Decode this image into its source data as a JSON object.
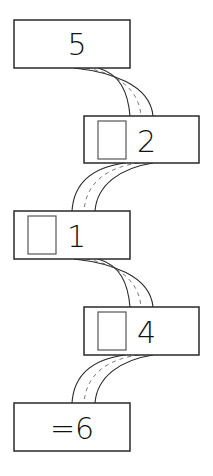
{
  "diagram": {
    "type": "number-chain",
    "boxes": [
      {
        "id": "start",
        "value": "5",
        "has_slot": false
      },
      {
        "id": "step1",
        "value": "2",
        "has_slot": true
      },
      {
        "id": "step2",
        "value": "1",
        "has_slot": true
      },
      {
        "id": "step3",
        "value": "4",
        "has_slot": true
      },
      {
        "id": "result",
        "value": "=6",
        "has_slot": false
      }
    ],
    "connectors": 4
  },
  "colors": {
    "stroke": "#2a2a2a",
    "background": "#ffffff"
  }
}
